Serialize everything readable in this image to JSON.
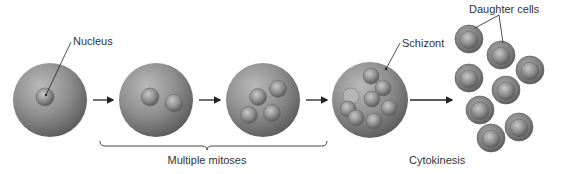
{
  "labels": {
    "nucleus": "Nucleus",
    "schizont": "Schizont",
    "daughter_cells": "Daughter cells",
    "multiple_mitoses": "Multiple mitoses",
    "cytokinesis": "Cytokinesis"
  },
  "colors": {
    "cell": "#8a8a8a",
    "nucleus": "#8e8e8e",
    "arrow": "#222222",
    "text": "#333333"
  }
}
